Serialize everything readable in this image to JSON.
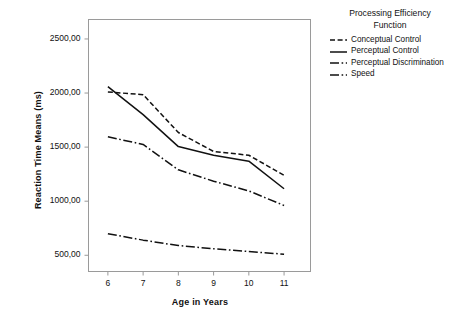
{
  "chart_data": {
    "type": "line",
    "title": "",
    "xlabel": "Age in Years",
    "ylabel": "Reaction Time Means (ms)",
    "x": [
      6,
      7,
      8,
      9,
      10,
      11
    ],
    "xtick_labels": [
      "6",
      "7",
      "8",
      "9",
      "10",
      "11"
    ],
    "ytick_labels": [
      "500,00",
      "1000,00",
      "1500,00",
      "2000,00",
      "2500,00"
    ],
    "ytick_values": [
      500,
      1000,
      1500,
      2000,
      2500
    ],
    "ylim": [
      350,
      2680
    ],
    "xlim": [
      5.45,
      11.75
    ],
    "grid": false,
    "legend_position": "right",
    "legend_title": "Processing Efficiency Function",
    "series": [
      {
        "name": "Conceptual Control",
        "style": "dashed",
        "values": [
          2010,
          1985,
          1635,
          1460,
          1425,
          1240
        ]
      },
      {
        "name": "Perceptual Control",
        "style": "solid",
        "values": [
          2060,
          1800,
          1505,
          1425,
          1370,
          1115
        ]
      },
      {
        "name": "Perceptual Discrimination",
        "style": "long-dash-dot",
        "values": [
          1595,
          1525,
          1290,
          1185,
          1095,
          960
        ]
      },
      {
        "name": "Speed",
        "style": "dash-dot",
        "values": [
          700,
          640,
          590,
          560,
          535,
          510
        ]
      }
    ]
  },
  "legend": {
    "title_line_1": "Processing Efficiency",
    "title_line_2": "Function",
    "entries": [
      {
        "label": "Conceptual Control"
      },
      {
        "label": "Perceptual Control"
      },
      {
        "label": "Perceptual Discrimination"
      },
      {
        "label": "Speed"
      }
    ]
  },
  "colors": {
    "line": "#111111",
    "axis": "#9a9a9a",
    "background": "#ffffff"
  }
}
